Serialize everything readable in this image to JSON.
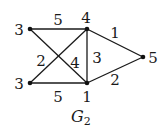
{
  "graph": {
    "caption": "G",
    "caption_subscript": "2",
    "nodes": [
      {
        "id": "top-left",
        "label": "3",
        "x": 30,
        "y": 29,
        "lx": 19,
        "ly": 35
      },
      {
        "id": "top-middle",
        "label": "4",
        "x": 87,
        "y": 29,
        "lx": 86,
        "ly": 23
      },
      {
        "id": "bottom-left",
        "label": "3",
        "x": 30,
        "y": 83,
        "lx": 19,
        "ly": 89
      },
      {
        "id": "bottom-middle",
        "label": "1",
        "x": 87,
        "y": 83,
        "lx": 87,
        "ly": 102
      },
      {
        "id": "right",
        "label": "5",
        "x": 143,
        "y": 57,
        "lx": 153,
        "ly": 63
      }
    ],
    "edges": [
      {
        "from": "top-left",
        "to": "top-middle",
        "weight": "5",
        "lx": 58,
        "ly": 25
      },
      {
        "from": "top-left",
        "to": "bottom-middle",
        "weight": "4",
        "lx": 75,
        "ly": 68
      },
      {
        "from": "bottom-left",
        "to": "top-middle",
        "weight": "2",
        "lx": 41,
        "ly": 66
      },
      {
        "from": "bottom-left",
        "to": "bottom-middle",
        "weight": "5",
        "lx": 58,
        "ly": 102
      },
      {
        "from": "top-middle",
        "to": "bottom-middle",
        "weight": "3",
        "lx": 97,
        "ly": 63
      },
      {
        "from": "top-middle",
        "to": "right",
        "weight": "1",
        "lx": 115,
        "ly": 38
      },
      {
        "from": "bottom-middle",
        "to": "right",
        "weight": "2",
        "lx": 115,
        "ly": 85
      }
    ],
    "colors": {
      "stroke": "#1a1a1a",
      "node": "#111111",
      "background": "#ffffff"
    }
  }
}
